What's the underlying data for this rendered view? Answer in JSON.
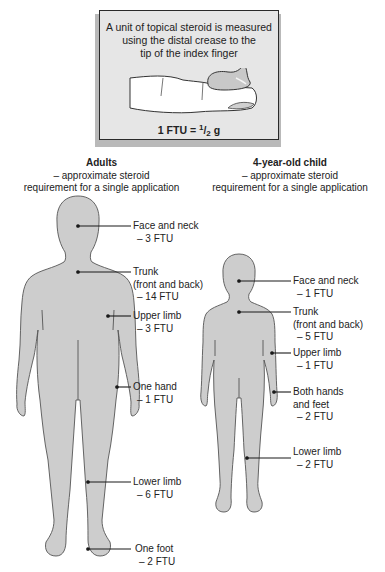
{
  "info_box": {
    "lines": [
      "A unit of topical steroid is measured",
      "using the distal crease to the",
      "tip of the index finger"
    ],
    "formula_prefix": "1 FTU = ",
    "formula_num": "1",
    "formula_slash": "/",
    "formula_den": "2",
    "formula_unit": " g",
    "illustration": "index-finger-with-cream"
  },
  "adult": {
    "title": "Adults",
    "subtitle_1": "– approximate steroid",
    "subtitle_2": "requirement for a single application",
    "labels": [
      {
        "name": "Face and neck",
        "extra": "",
        "value": "– 3 FTU"
      },
      {
        "name": "Trunk",
        "extra": "(front and back)",
        "value": "– 14 FTU"
      },
      {
        "name": "Upper limb",
        "extra": "",
        "value": "– 3 FTU"
      },
      {
        "name": "One hand",
        "extra": "",
        "value": "– 1 FTU"
      },
      {
        "name": "Lower limb",
        "extra": "",
        "value": "– 6 FTU"
      },
      {
        "name": "One foot",
        "extra": "",
        "value": "– 2 FTU"
      }
    ]
  },
  "child": {
    "title": "4-year-old child",
    "subtitle_1": "– approximate steroid",
    "subtitle_2": "requirement for a single application",
    "labels": [
      {
        "name": "Face and neck",
        "extra": "",
        "value": "– 1 FTU"
      },
      {
        "name": "Trunk",
        "extra": "(front and back)",
        "value": "– 5 FTU"
      },
      {
        "name": "Upper limb",
        "extra": "",
        "value": "– 1 FTU"
      },
      {
        "name": "Both hands",
        "extra": "and feet",
        "value": "– 2 FTU"
      },
      {
        "name": "Lower limb",
        "extra": "",
        "value": "– 2 FTU"
      }
    ]
  },
  "colors": {
    "body_fill": "#cdcdcd",
    "body_outline": "#555555",
    "box_fill": "#e6e6e6",
    "box_border": "#2a2a2a",
    "leader_line": "#1a1a1a"
  }
}
